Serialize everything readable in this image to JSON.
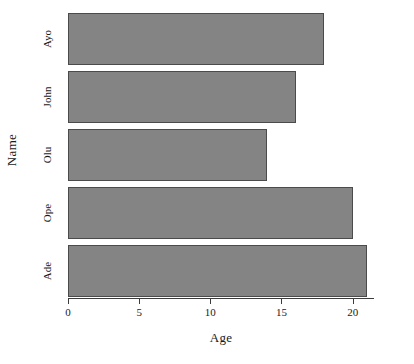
{
  "chart_data": {
    "type": "bar",
    "orientation": "horizontal",
    "title": "",
    "xlabel": "Age",
    "ylabel": "Name",
    "categories": [
      "Ayo",
      "John",
      "Olu",
      "Ope",
      "Ade"
    ],
    "values": [
      18,
      16,
      14,
      20,
      21
    ],
    "xlim": [
      0,
      21.5
    ],
    "xticks": [
      0,
      5,
      10,
      15,
      20
    ],
    "xtick_labels": [
      "0",
      "5",
      "10",
      "15",
      "20"
    ],
    "grid": false,
    "legend": null,
    "bar_color": "#848484",
    "bar_edge_color": "#4b4b4b",
    "axis_color": "#3c3c3c",
    "background": "#ffffff"
  },
  "axes": {
    "x_title": "Age",
    "y_title": "Name"
  }
}
